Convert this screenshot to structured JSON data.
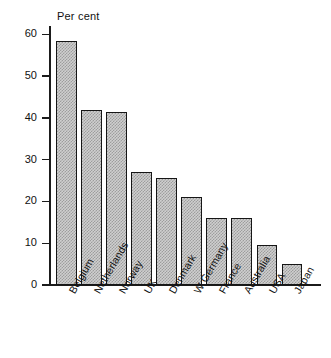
{
  "chart_data": {
    "type": "bar",
    "title": "",
    "ylabel": "Per cent",
    "xlabel": "",
    "categories": [
      "Belgium",
      "Netherlands",
      "Norway",
      "UK",
      "Denmark",
      "W Germany",
      "France",
      "Australia",
      "USA",
      "Japan"
    ],
    "values": [
      58.5,
      42,
      41.5,
      27,
      25.5,
      21,
      16,
      16,
      9.5,
      5
    ],
    "ylim": [
      0,
      62
    ],
    "yticks": [
      0,
      10,
      20,
      30,
      40,
      50,
      60
    ],
    "ytick_labels": [
      "0",
      "10",
      "20",
      "30",
      "40",
      "50",
      "60"
    ],
    "grid": false,
    "legend": null,
    "bar_fill_color": "#cfcfcf",
    "bar_edge_color": "#161616",
    "background_color": "#ffffff"
  }
}
